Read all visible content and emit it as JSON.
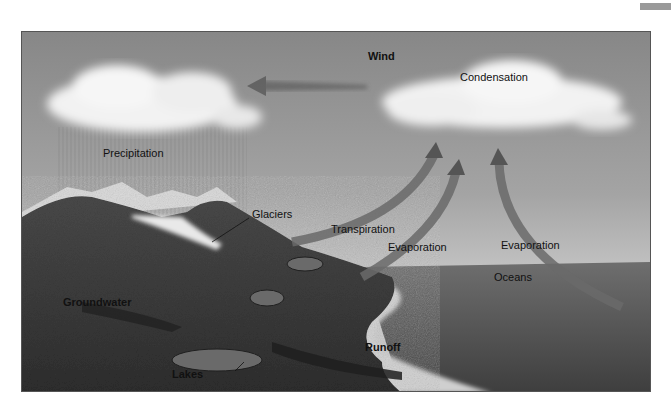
{
  "diagram": {
    "type": "water-cycle",
    "labels": {
      "wind": "Wind",
      "condensation": "Condensation",
      "precipitation": "Precipitation",
      "glaciers": "Glaciers",
      "transpiration": "Transpiration",
      "evaporation_land": "Evaporation",
      "evaporation_ocean": "Evaporation",
      "oceans": "Oceans",
      "groundwater": "Groundwater",
      "runoff": "Runoff",
      "lakes": "Lakes"
    },
    "colors": {
      "sky_top": "#8a8a8a",
      "sky_bottom": "#c4c4c4",
      "cloud": "#f4f4f4",
      "arrow": "#6a6a6a",
      "land": "#3c3c3c",
      "ocean": "#5a5a5a",
      "beach": "#cfcfcf",
      "text": "#111111"
    }
  }
}
